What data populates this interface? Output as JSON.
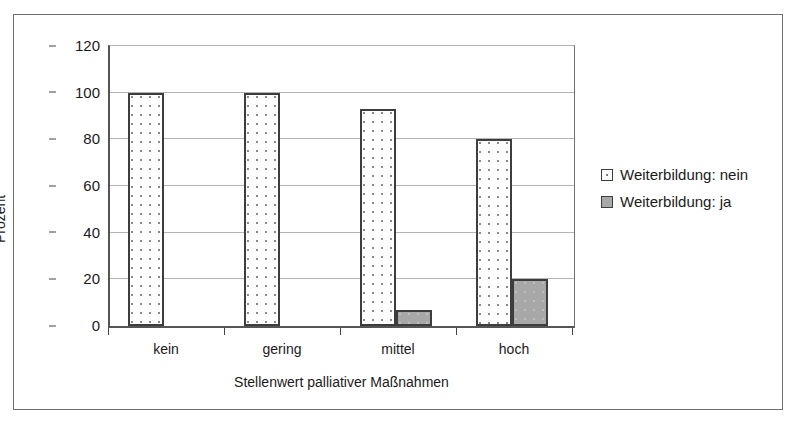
{
  "chart_data": {
    "type": "bar",
    "title": "",
    "xlabel": "Stellenwert palliativer Maßnahmen",
    "ylabel": "Prozent",
    "categories": [
      "kein",
      "gering",
      "mittel",
      "hoch"
    ],
    "series": [
      {
        "name": "Weiterbildung: nein",
        "values": [
          100,
          100,
          93,
          80
        ],
        "color": "#ffffff",
        "pattern": "dotted"
      },
      {
        "name": "Weiterbildung: ja",
        "values": [
          0,
          0,
          7,
          20
        ],
        "color": "#a8a8a8",
        "pattern": "solid-gray"
      }
    ],
    "ylim": [
      0,
      120
    ],
    "yticks": [
      0,
      20,
      40,
      60,
      80,
      100,
      120
    ],
    "ytick_labels": [
      "0",
      "20",
      "40",
      "60",
      "80",
      "100",
      "120"
    ],
    "grid": true,
    "grid_axis": "y",
    "legend_position": "right",
    "legend_entries": [
      "Weiterbildung: nein",
      "Weiterbildung: ja"
    ]
  },
  "axes": {
    "y_title": "Prozent",
    "x_title": "Stellenwert palliativer Maßnahmen"
  }
}
